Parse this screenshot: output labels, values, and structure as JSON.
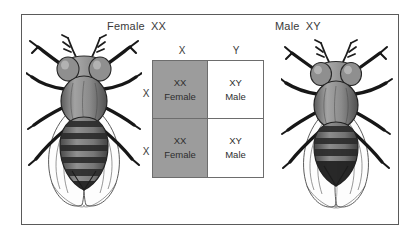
{
  "figure": {
    "title_female": "Female",
    "title_female_genotype": "XX",
    "title_male": "Male",
    "title_male_genotype": "XY",
    "organism": "fruit-fly"
  },
  "punnett": {
    "column_headers": [
      "X",
      "Y"
    ],
    "row_headers": [
      "X",
      "X"
    ],
    "cells": [
      {
        "genotype": "XX",
        "phenotype": "Female",
        "shaded": true
      },
      {
        "genotype": "XY",
        "phenotype": "Male",
        "shaded": false
      },
      {
        "genotype": "XX",
        "phenotype": "Female",
        "shaded": true
      },
      {
        "genotype": "XY",
        "phenotype": "Male",
        "shaded": false
      }
    ]
  },
  "colors": {
    "shaded_cell": "#9c9c9c",
    "plain_cell": "#ffffff",
    "grid_line": "#6d6d6d",
    "frame": "#5a5a5a",
    "text": "#3a3a3a"
  },
  "icons": {
    "female_fly": "fruit-fly-icon",
    "male_fly": "fruit-fly-icon"
  }
}
